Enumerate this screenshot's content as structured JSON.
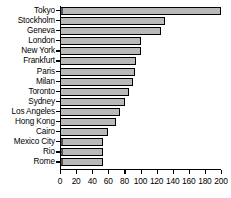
{
  "chart_data": {
    "type": "bar",
    "orientation": "horizontal",
    "title": "",
    "xlabel": "",
    "ylabel": "",
    "xlim": [
      0,
      200
    ],
    "xticks": [
      0,
      20,
      40,
      60,
      80,
      100,
      120,
      140,
      160,
      180,
      200
    ],
    "grid": false,
    "legend": null,
    "bar_fill": "#b9b9b9",
    "bar_pattern": "checkerboard-dither",
    "bar_edge_color": "#000000",
    "categories": [
      "Tokyo",
      "Stockholm",
      "Geneva",
      "London",
      "New York",
      "Frankfurt",
      "Paris",
      "Milan",
      "Toronto",
      "Sydney",
      "Los Angeles",
      "Hong Kong",
      "Cairo",
      "Mexico City",
      "Rio",
      "Rome"
    ],
    "values": [
      200,
      130,
      125,
      101,
      100,
      94,
      93,
      91,
      86,
      81,
      74,
      70,
      60,
      54,
      54,
      54
    ]
  }
}
